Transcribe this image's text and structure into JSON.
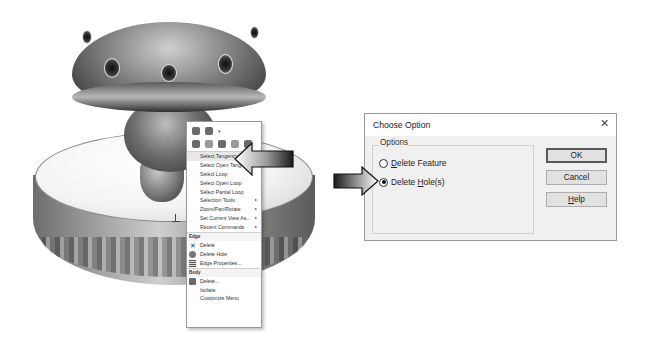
{
  "context_menu": {
    "toolbar_rows": [
      [
        "selection-icon",
        "appearance-icon"
      ],
      [
        "view-icon",
        "hide-icon",
        "sketch-icon",
        "normal-to-icon",
        "help-icon"
      ]
    ],
    "items": [
      {
        "label": "Select Tangency",
        "highlighted": true
      },
      {
        "label": "Select Open Tangency"
      },
      {
        "label": "Select Loop"
      },
      {
        "label": "Select Open Loop"
      },
      {
        "label": "Select Partial Loop"
      },
      {
        "label": "Selection Tools",
        "submenu": true
      },
      {
        "label": "Zoom/Pan/Rotate",
        "submenu": true
      },
      {
        "label": "Set Current View As...",
        "submenu": true
      },
      {
        "label": "Recent Commands",
        "submenu": true
      }
    ],
    "edge_section": {
      "title": "Edge",
      "items": [
        {
          "label": "Delete",
          "icon": "delete-x-icon"
        },
        {
          "label": "Delete Hole",
          "icon": "delete-hole-icon"
        },
        {
          "label": "Edge Properties...",
          "icon": "edge-properties-icon"
        }
      ]
    },
    "body_section": {
      "title": "Body",
      "items": [
        {
          "label": "Delete...",
          "icon": "delete-body-icon"
        },
        {
          "label": "Isolate"
        },
        {
          "label": "Customize Menu"
        }
      ]
    },
    "submenu_glyph": "▸"
  },
  "dialog": {
    "title": "Choose Option",
    "close_glyph": "✕",
    "group_label": "Options",
    "options": [
      {
        "prefix": "",
        "ul": "D",
        "rest": "elete Feature",
        "checked": false
      },
      {
        "prefix": "Delete ",
        "ul": "H",
        "rest": "ole(s)",
        "checked": true
      }
    ],
    "buttons": {
      "ok": "OK",
      "cancel": "Cancel",
      "help_ul": "H",
      "help_rest": "elp"
    }
  }
}
